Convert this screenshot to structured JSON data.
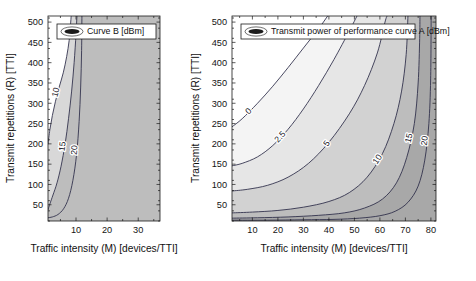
{
  "figure": {
    "background": "#ffffff",
    "panel_count": 2
  },
  "chart_data": [
    {
      "type": "contour",
      "panel": "left",
      "title": "",
      "legend": {
        "label": "Curve B [dBm]",
        "position": "top-left-inside",
        "marker": "filled-ellipse-line-sample"
      },
      "xlabel": "Traffic intensity (M) [devices/TTI]",
      "ylabel": "Transmit repetitions (R) [TTI]",
      "xlim": [
        1,
        37
      ],
      "ylim": [
        10,
        515
      ],
      "xticks": [
        10,
        20,
        30
      ],
      "yticks": [
        50,
        100,
        150,
        200,
        250,
        300,
        350,
        400,
        450,
        500
      ],
      "grid": false,
      "contour_levels": [
        10,
        15,
        20
      ],
      "level_colors": [
        "#f0f0f0",
        "#d8d8d8",
        "#bdbdbd"
      ],
      "contour_labels": [
        "10",
        "15",
        "20"
      ],
      "shaded_region_note": "Feasible band is a narrow vertical wedge at low traffic intensity (M between ~1 and ~12 devices/TTI); region is unshaded (white) to the right of M about 12.",
      "contours": [
        {
          "level": 10,
          "label": "10",
          "points": [
            [
              1.0,
              200
            ],
            [
              1.6,
              235
            ],
            [
              2.4,
              270
            ],
            [
              3.4,
              305
            ],
            [
              4.6,
              340
            ],
            [
              5.9,
              375
            ],
            [
              7.0,
              415
            ],
            [
              7.8,
              455
            ],
            [
              8.3,
              500
            ],
            [
              8.45,
              515
            ]
          ]
        },
        {
          "level": 15,
          "label": "15",
          "points": [
            [
              1.0,
              38
            ],
            [
              1.6,
              52
            ],
            [
              2.6,
              74
            ],
            [
              3.9,
              104
            ],
            [
              5.2,
              145
            ],
            [
              6.5,
              200
            ],
            [
              7.6,
              262
            ],
            [
              8.6,
              330
            ],
            [
              9.4,
              400
            ],
            [
              10.0,
              470
            ],
            [
              10.3,
              515
            ]
          ]
        },
        {
          "level": 20,
          "label": "20",
          "points": [
            [
              1.0,
              18
            ],
            [
              2.4,
              20
            ],
            [
              4.2,
              26
            ],
            [
              6.0,
              40
            ],
            [
              7.6,
              66
            ],
            [
              9.0,
              110
            ],
            [
              10.2,
              175
            ],
            [
              11.0,
              255
            ],
            [
              11.5,
              340
            ],
            [
              11.8,
              430
            ],
            [
              11.9,
              515
            ]
          ]
        }
      ]
    },
    {
      "type": "contour",
      "panel": "right",
      "title": "",
      "legend": {
        "label": "Transmit power of performance curve A [dBm]",
        "position": "top-left-inside",
        "marker": "filled-ellipse-line-sample"
      },
      "xlabel": "Traffic intensity (M) [devices/TTI]",
      "ylabel": "Transmit repetitions (R) [TTI]",
      "xlim": [
        2,
        82
      ],
      "ylim": [
        10,
        515
      ],
      "xticks": [
        10,
        20,
        30,
        40,
        50,
        60,
        70,
        80
      ],
      "yticks": [
        50,
        100,
        150,
        200,
        250,
        300,
        350,
        400,
        450,
        500
      ],
      "grid": false,
      "contour_levels": [
        0,
        2.5,
        5,
        10,
        15,
        20
      ],
      "level_colors": [
        "#ffffff",
        "#f4f4f4",
        "#e6e6e6",
        "#d2d2d2",
        "#bdbdbd",
        "#a8a8a8"
      ],
      "contour_labels": [
        "0",
        "2.5",
        "5",
        "10",
        "15",
        "20"
      ],
      "shaded_region_note": "Grey shading increases towards the lower-right; white region in the upper-left corresponds to values below 0 dBm.",
      "contours": [
        {
          "level": 0,
          "label": "0",
          "points": [
            [
              2.0,
              242
            ],
            [
              6.0,
              262
            ],
            [
              12.0,
              300
            ],
            [
              18.0,
              342
            ],
            [
              24.0,
              388
            ],
            [
              30.0,
              436
            ],
            [
              36.0,
              484
            ],
            [
              39.5,
              515
            ]
          ]
        },
        {
          "level": 2.5,
          "label": "2.5",
          "points": [
            [
              2.0,
              146
            ],
            [
              6.0,
              152
            ],
            [
              12.0,
              168
            ],
            [
              18.0,
              196
            ],
            [
              24.0,
              236
            ],
            [
              30.0,
              286
            ],
            [
              36.0,
              344
            ],
            [
              42.0,
              408
            ],
            [
              48.0,
              478
            ],
            [
              51.0,
              515
            ]
          ]
        },
        {
          "level": 5,
          "label": "5",
          "points": [
            [
              2.0,
              84
            ],
            [
              8.0,
              88
            ],
            [
              16.0,
              98
            ],
            [
              24.0,
              118
            ],
            [
              32.0,
              152
            ],
            [
              40.0,
              204
            ],
            [
              48.0,
              274
            ],
            [
              54.0,
              344
            ],
            [
              59.0,
              424
            ],
            [
              62.0,
              500
            ],
            [
              62.8,
              515
            ]
          ]
        },
        {
          "level": 10,
          "label": "10",
          "points": [
            [
              2.0,
              30
            ],
            [
              10.0,
              32
            ],
            [
              20.0,
              36
            ],
            [
              30.0,
              44
            ],
            [
              40.0,
              58
            ],
            [
              48.0,
              80
            ],
            [
              55.0,
              118
            ],
            [
              61.0,
              176
            ],
            [
              65.5,
              250
            ],
            [
              68.5,
              330
            ],
            [
              70.3,
              420
            ],
            [
              71.0,
              515
            ]
          ]
        },
        {
          "level": 15,
          "label": "15",
          "points": [
            [
              2.0,
              17
            ],
            [
              12.0,
              18
            ],
            [
              24.0,
              20
            ],
            [
              36.0,
              24
            ],
            [
              46.0,
              30
            ],
            [
              54.0,
              42
            ],
            [
              61.0,
              64
            ],
            [
              66.5,
              104
            ],
            [
              70.5,
              166
            ],
            [
              73.5,
              250
            ],
            [
              75.0,
              350
            ],
            [
              75.6,
              460
            ],
            [
              75.7,
              515
            ]
          ]
        },
        {
          "level": 20,
          "label": "20",
          "points": [
            [
              2.0,
              12
            ],
            [
              16.0,
              12
            ],
            [
              30.0,
              13
            ],
            [
              42.0,
              14
            ],
            [
              52.0,
              17
            ],
            [
              60.0,
              23
            ],
            [
              66.0,
              34
            ],
            [
              71.0,
              56
            ],
            [
              75.0,
              96
            ],
            [
              77.6,
              160
            ],
            [
              79.2,
              250
            ],
            [
              79.9,
              360
            ],
            [
              80.1,
              515
            ]
          ]
        }
      ]
    }
  ]
}
